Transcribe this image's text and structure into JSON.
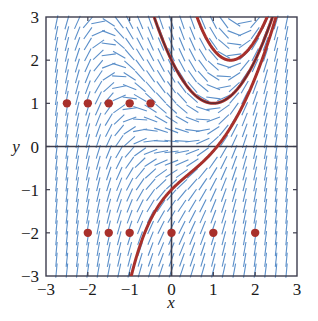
{
  "figure": {
    "name": "slope-field-with-solution-curves",
    "background": "#ffffff"
  },
  "chart_data": {
    "type": "scatter",
    "title": "",
    "subtitle": "",
    "xlabel": "x",
    "ylabel": "y",
    "xlim": [
      -3,
      3
    ],
    "ylim": [
      -3,
      3
    ],
    "xticks": [
      -3,
      -2,
      -1,
      0,
      1,
      2,
      3
    ],
    "yticks": [
      -3,
      -2,
      -1,
      0,
      1,
      2,
      3
    ],
    "xtick_labels": [
      "−3",
      "−2",
      "−1",
      "0",
      "1",
      "2",
      "3"
    ],
    "ytick_labels": [
      "−3",
      "−2",
      "−1",
      "0",
      "1",
      "2",
      "3"
    ],
    "grid": false,
    "legend": null,
    "axes_style": "box-frame-with-crosshair-axes",
    "slope_field": {
      "name": "direction-field",
      "color": "#5b8fc9",
      "equation": "dy/dx = x^2 - y",
      "x_start": -2.75,
      "x_end": 2.75,
      "x_step": 0.25,
      "y_start": -2.875,
      "y_end": 2.875,
      "y_step": 0.25,
      "dash_length": 0.17,
      "stroke_width": 1.1
    },
    "solution_curves": {
      "name": "solution-curves",
      "color_outer": "#a8302b",
      "color_inner": "#2b2b3c",
      "stroke_width_outer": 3.0,
      "stroke_width_inner": 1.0,
      "curves": [
        {
          "name": "upper-branch",
          "C": 3.4,
          "comment": "y = x^2 - 2x + 2 + C e^{-x}"
        },
        {
          "name": "separatrix",
          "C": 0.0,
          "comment": "y = x^2 - 2x + 2"
        },
        {
          "name": "lower-branch",
          "C": -3.0,
          "comment": "y = x^2 - 2x + 2 + C e^{-x}"
        }
      ]
    },
    "points": {
      "name": "initial-condition-points",
      "color": "#a8302b",
      "radius": 4.2,
      "series": [
        {
          "name": "points-at-y-1",
          "y": 1,
          "x": [
            -2.5,
            -2.0,
            -1.5,
            -1.0,
            -0.5
          ]
        },
        {
          "name": "points-at-y-minus-2",
          "y": -2,
          "x": [
            -2.0,
            -1.5,
            -1.0,
            0.0,
            1.0,
            2.0
          ]
        }
      ]
    }
  }
}
